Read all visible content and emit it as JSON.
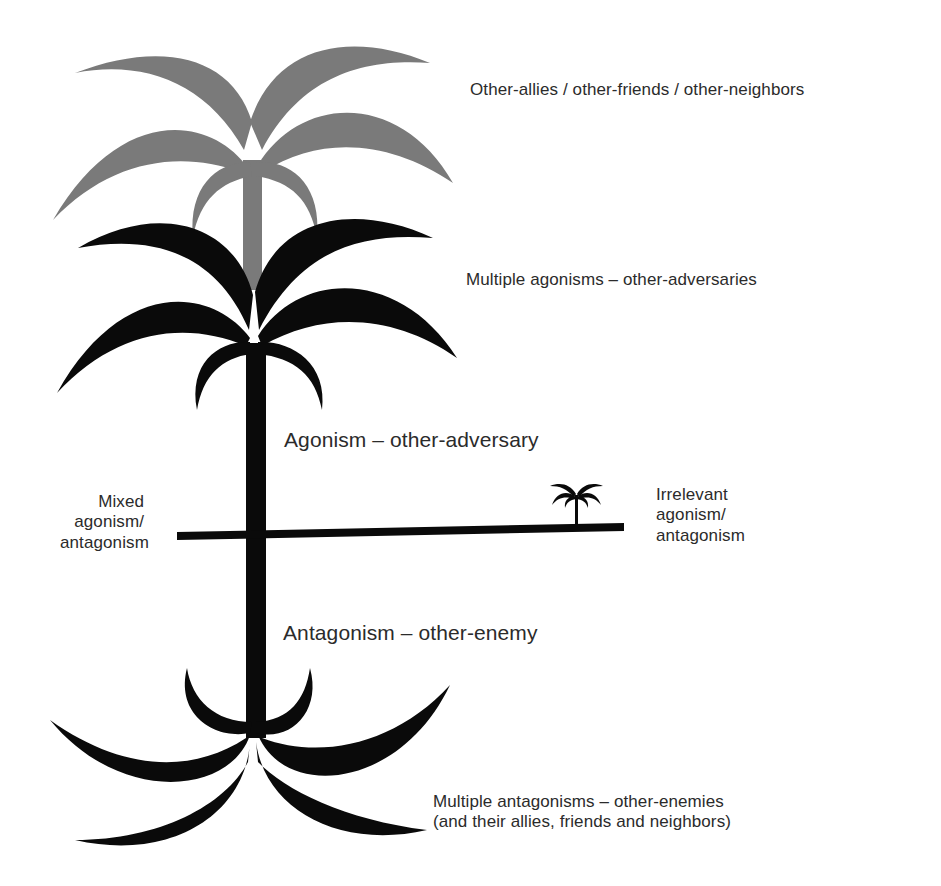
{
  "diagram": {
    "title": "",
    "colors": {
      "background": "#ffffff",
      "allies_crown": "#7a7a7a",
      "adversaries": "#0a0a0a",
      "text": "#2b2b2b"
    },
    "labels": {
      "allies": "Other-allies / other-friends / other-neighbors",
      "multiple_agonisms": "Multiple agonisms – other-adversaries",
      "agonism": "Agonism – other-adversary",
      "mixed": {
        "line1": "Mixed",
        "line2": "agonism/",
        "line3": "antagonism"
      },
      "irrelevant": {
        "line1": "Irrelevant",
        "line2": "agonism/",
        "line3": "antagonism"
      },
      "antagonism": "Antagonism – other-enemy",
      "multiple_antagonisms": {
        "line1": "Multiple antagonisms – other-enemies",
        "line2": "(and their allies, friends and neighbors)"
      }
    },
    "elements": [
      {
        "id": "gray-crown",
        "meaning": "Other-allies / other-friends / other-neighbors",
        "color": "#7a7a7a"
      },
      {
        "id": "black-crown",
        "meaning": "Multiple agonisms – other-adversaries",
        "color": "#0a0a0a"
      },
      {
        "id": "trunk-upper",
        "meaning": "Agonism – other-adversary"
      },
      {
        "id": "horizon-line",
        "meaning": "Mixed agonism/antagonism (left) – Irrelevant agonism/antagonism (right)"
      },
      {
        "id": "small-palm",
        "meaning": "Irrelevant agonism/antagonism"
      },
      {
        "id": "trunk-lower",
        "meaning": "Antagonism – other-enemy"
      },
      {
        "id": "root-crown",
        "meaning": "Multiple antagonisms – other-enemies (and their allies, friends and neighbors)"
      }
    ]
  }
}
